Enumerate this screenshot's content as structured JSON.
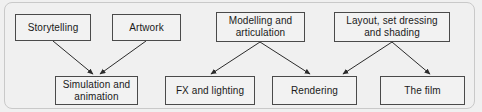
{
  "diagram": {
    "background_color": "#f0f0f0",
    "frame_color": "#c9c9c9",
    "node_fill": "#f2f2f2",
    "node_border_color": "#4a4a4a",
    "edge_color": "#2b2b2b",
    "text_color": "#1a1a1a",
    "nodes": [
      {
        "id": "storytelling",
        "label": "Storytelling",
        "x": 15,
        "y": 14,
        "w": 76,
        "h": 27,
        "row": "top"
      },
      {
        "id": "artwork",
        "label": "Artwork",
        "x": 112,
        "y": 14,
        "w": 69,
        "h": 27,
        "row": "top"
      },
      {
        "id": "modelling",
        "label": "Modelling and\narticulation",
        "x": 216,
        "y": 12,
        "w": 89,
        "h": 30,
        "row": "top"
      },
      {
        "id": "layout",
        "label": "Layout, set dressing\nand shading",
        "x": 334,
        "y": 12,
        "w": 116,
        "h": 30,
        "row": "top"
      },
      {
        "id": "simulation",
        "label": "Simulation and\nanimation",
        "x": 55,
        "y": 76,
        "w": 83,
        "h": 29,
        "row": "bottom"
      },
      {
        "id": "fx",
        "label": "FX and lighting",
        "x": 165,
        "y": 76,
        "w": 90,
        "h": 29,
        "row": "bottom"
      },
      {
        "id": "rendering",
        "label": "Rendering",
        "x": 272,
        "y": 76,
        "w": 85,
        "h": 29,
        "row": "bottom"
      },
      {
        "id": "thefilm",
        "label": "The film",
        "x": 380,
        "y": 76,
        "w": 85,
        "h": 29,
        "row": "bottom"
      }
    ],
    "edges": [
      {
        "from": "storytelling",
        "to": "simulation",
        "x1": 53,
        "y1": 41,
        "x2": 93,
        "y2": 74
      },
      {
        "from": "artwork",
        "to": "simulation",
        "x1": 146,
        "y1": 41,
        "x2": 100,
        "y2": 74
      },
      {
        "from": "modelling",
        "to": "fx",
        "x1": 260,
        "y1": 42,
        "x2": 211,
        "y2": 74
      },
      {
        "from": "modelling",
        "to": "rendering",
        "x1": 260,
        "y1": 42,
        "x2": 310,
        "y2": 74
      },
      {
        "from": "layout",
        "to": "rendering",
        "x1": 392,
        "y1": 42,
        "x2": 343,
        "y2": 74
      },
      {
        "from": "layout",
        "to": "thefilm",
        "x1": 392,
        "y1": 42,
        "x2": 430,
        "y2": 74
      }
    ]
  }
}
